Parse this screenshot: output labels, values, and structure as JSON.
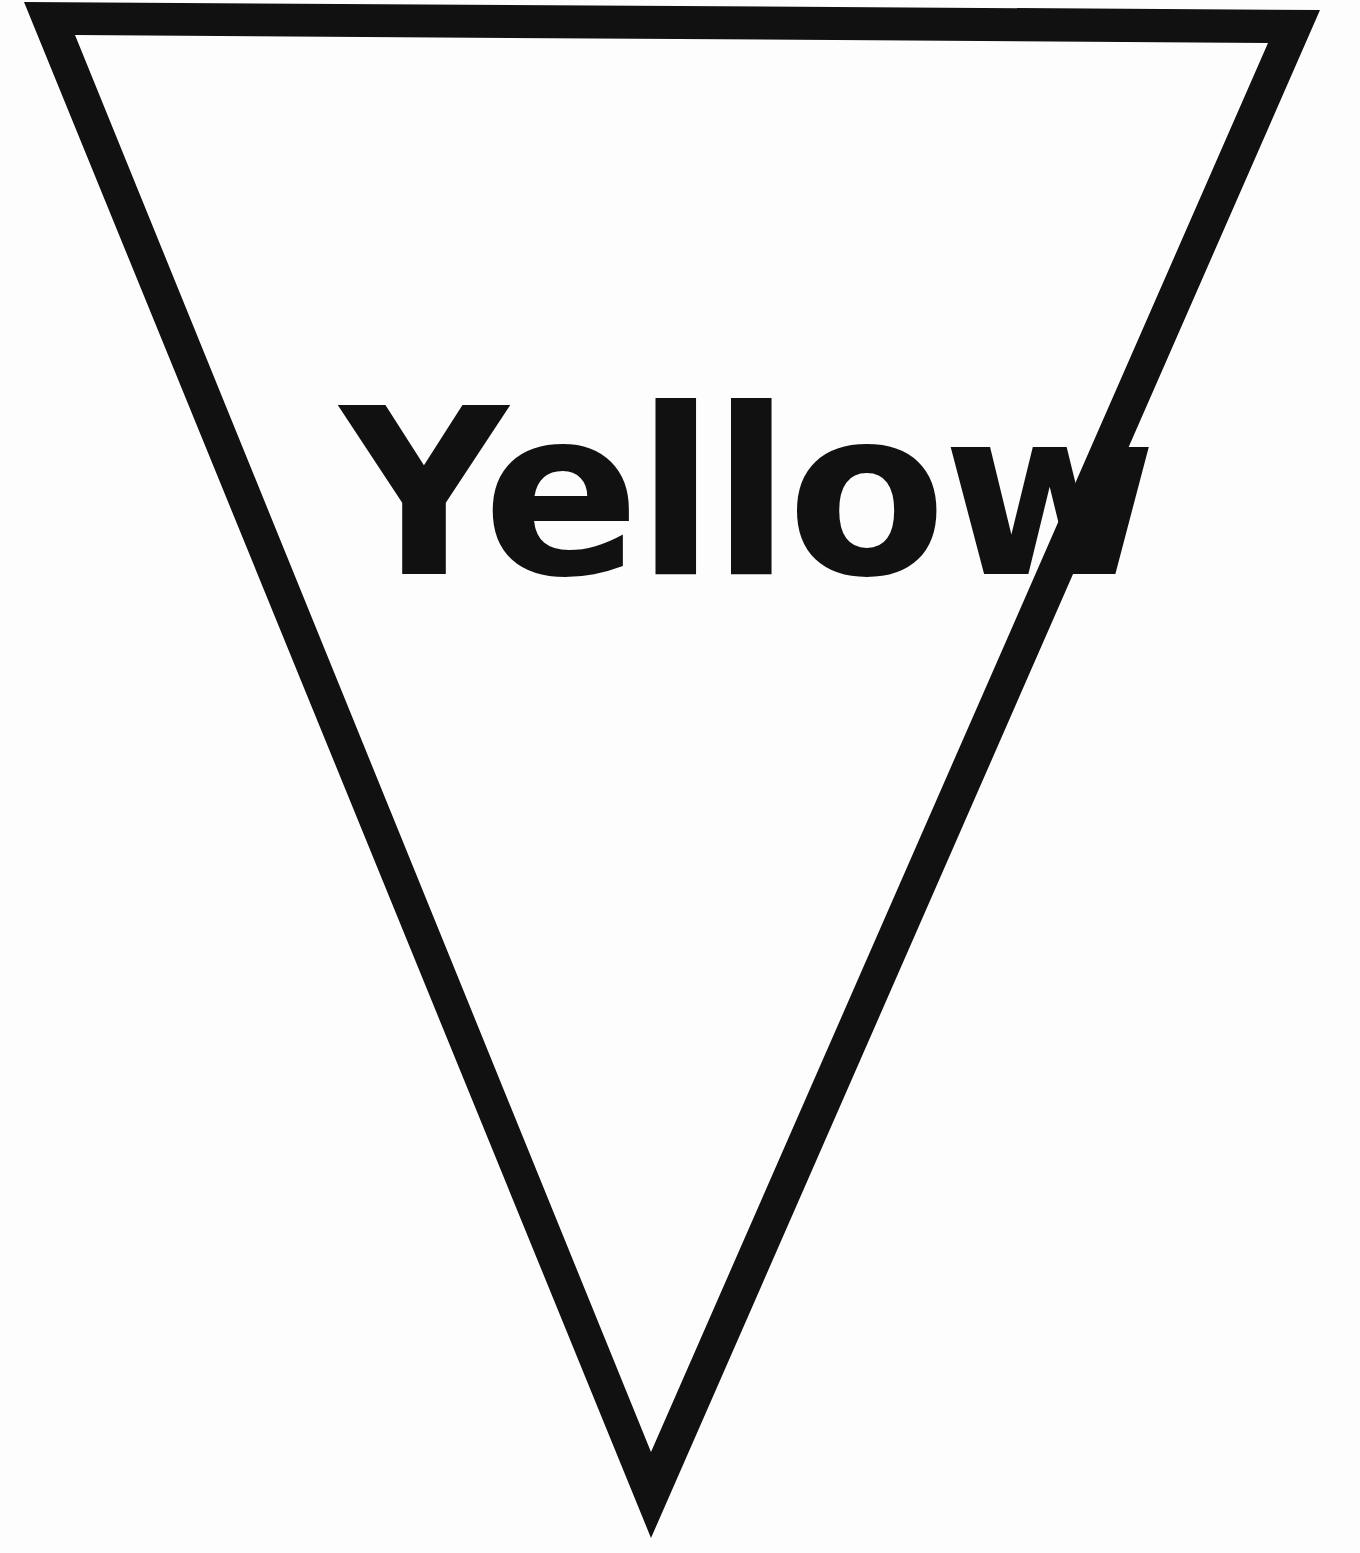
{
  "pennant": {
    "label": "Yellow",
    "shape": "inverted-triangle",
    "outline_color": "#111111",
    "fill_color": "#ffffff"
  }
}
